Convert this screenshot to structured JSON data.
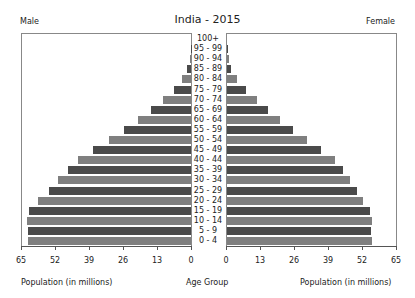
{
  "chart_data": {
    "type": "bar",
    "subtype": "population-pyramid",
    "title": "India - 2015",
    "left_label": "Male",
    "right_label": "Female",
    "xlabel_left": "Population (in millions)",
    "xlabel_center": "Age Group",
    "xlabel_right": "Population (in millions)",
    "xlim": [
      0,
      65
    ],
    "xticks_left": [
      "65",
      "52",
      "39",
      "26",
      "13",
      "0"
    ],
    "xticks_right": [
      "0",
      "13",
      "26",
      "39",
      "52",
      "65"
    ],
    "grid": false,
    "categories": [
      "100+",
      "95 - 99",
      "90 - 94",
      "85 - 89",
      "80 - 84",
      "75 - 79",
      "70 - 74",
      "65 - 69",
      "60 - 64",
      "55 - 59",
      "50 - 54",
      "45 - 49",
      "40 - 44",
      "35 - 39",
      "30 - 34",
      "25 - 29",
      "20 - 24",
      "15 - 19",
      "10 - 14",
      "5 - 9",
      "0 - 4"
    ],
    "series": [
      {
        "name": "Male",
        "values": [
          0.0,
          0.1,
          0.4,
          1.5,
          3.4,
          6.5,
          10.7,
          15.3,
          20.3,
          25.6,
          31.4,
          37.5,
          43.2,
          47.0,
          50.9,
          54.3,
          58.5,
          61.9,
          62.7,
          62.3,
          62.3
        ]
      },
      {
        "name": "Female",
        "values": [
          0.0,
          0.2,
          0.8,
          1.5,
          3.8,
          7.3,
          11.5,
          15.7,
          20.3,
          25.2,
          30.6,
          35.9,
          41.3,
          44.4,
          47.0,
          49.7,
          52.0,
          54.7,
          55.4,
          55.1,
          55.4
        ]
      }
    ],
    "colors": {
      "dark": "#4a4a4a",
      "light": "#7f7f7f",
      "axis": "#555555",
      "border": "#888888"
    }
  }
}
